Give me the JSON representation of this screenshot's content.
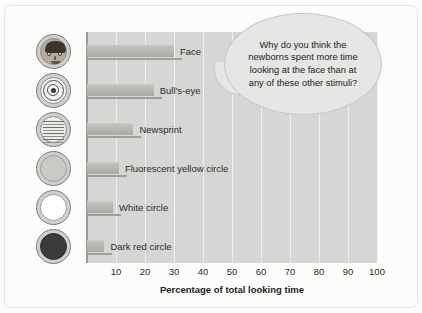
{
  "chart_data": {
    "type": "bar",
    "orientation": "horizontal",
    "title": "",
    "xlabel": "Percentage of total looking time",
    "ylabel": "",
    "xlim": [
      0,
      100
    ],
    "xticks": [
      10,
      20,
      30,
      40,
      50,
      60,
      70,
      80,
      90,
      100
    ],
    "grid": true,
    "legend": "none",
    "categories": [
      "Face",
      "Bull's-eye",
      "Newsprint",
      "Fluorescent yellow circle",
      "White circle",
      "Dark red circle"
    ],
    "values": [
      30,
      23,
      16,
      11,
      9,
      6
    ],
    "bar_color": "#b4b4b1",
    "plot_background": "#d6d6d4",
    "gridline_color": "#f0f0ee"
  },
  "stimuli": [
    {
      "icon": "face-icon",
      "label": "Face"
    },
    {
      "icon": "bullseye-icon",
      "label": "Bull's-eye"
    },
    {
      "icon": "newsprint-icon",
      "label": "Newsprint"
    },
    {
      "icon": "fluorescent-yellow-circle-icon",
      "label": "Fluorescent yellow circle"
    },
    {
      "icon": "white-circle-icon",
      "label": "White circle"
    },
    {
      "icon": "dark-red-circle-icon",
      "label": "Dark red circle"
    }
  ],
  "annotation": {
    "bubble_text": "Why do you think the newborns spent more time looking at the face than at any of these other stimuli?",
    "bubble_fill": "#e6e6e4"
  }
}
